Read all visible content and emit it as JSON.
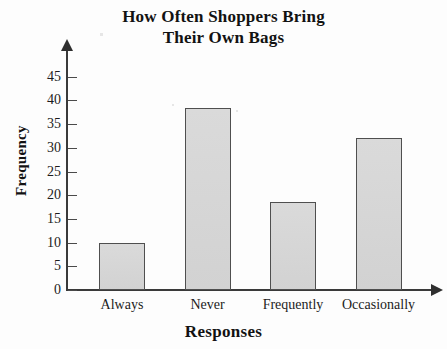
{
  "chart_data": {
    "type": "bar",
    "title": "How Often Shoppers Bring Their Own Bags",
    "title_line1": "How Often Shoppers Bring",
    "title_line2": "Their Own Bags",
    "xlabel": "Responses",
    "ylabel": "Frequency",
    "categories": [
      "Always",
      "Never",
      "Frequently",
      "Occasionally"
    ],
    "values": [
      10,
      38.5,
      18.5,
      32
    ],
    "ylim": [
      0,
      47
    ],
    "y_ticks": [
      0,
      5,
      10,
      15,
      20,
      25,
      30,
      35,
      40,
      45
    ],
    "y_tick_labels": [
      "0",
      "5",
      "10",
      "15",
      "20",
      "25",
      "30",
      "35",
      "40",
      "45"
    ],
    "grid": false,
    "legend": false,
    "bar_fill_color": "#d7d7d7",
    "bar_border_color": "#4f4f4f",
    "axis_color": "#3a3a3a",
    "text_color": "#121212",
    "background_color": "#fdfdfd"
  }
}
